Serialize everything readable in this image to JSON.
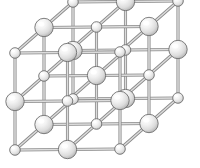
{
  "figure": {
    "title": "Rock-salt (NaCl-type) crystal lattice",
    "background_color": "#ffffff"
  },
  "style": {
    "large_sphere": {
      "radius": 9.2,
      "fill_light": "#ffffff",
      "fill_mid": "#e9e9e9",
      "fill_dark": "#b4b4b4",
      "stroke": "#6f6f6f",
      "stroke_width": 0.9
    },
    "small_sphere": {
      "radius": 5.3,
      "fill_light": "#ffffff",
      "fill_mid": "#ededed",
      "fill_dark": "#bcbcbc",
      "stroke": "#6f6f6f",
      "stroke_width": 0.9
    },
    "bond": {
      "outer_color": "#8a8a8a",
      "inner_color": "#dcdcdc",
      "outer_width": 3.1,
      "inner_width": 1.5
    }
  },
  "projection": {
    "type": "oblique-cavalier",
    "origin": {
      "x": 15,
      "y": 150
    },
    "axis_x": {
      "dx": 52.5,
      "dy": -0.5
    },
    "axis_y": {
      "dx": 0.0,
      "dy": -48.5
    },
    "axis_z": {
      "dx": 29.0,
      "dy": -25.5
    },
    "grid_counts": {
      "x": 3,
      "y": 3,
      "z": 3
    }
  },
  "lattice": {
    "kind": "rock-salt",
    "site_count": 27,
    "large_site_count": 13,
    "small_site_count": 14,
    "species": [
      {
        "name": "large-sphere-species",
        "label": "large ion",
        "size": "large"
      },
      {
        "name": "small-sphere-species",
        "label": "small ion",
        "size": "small"
      }
    ],
    "parity_rule": "a site (i,j,k) carries a large sphere when i+j+k is odd, otherwise a small sphere",
    "draw_order_note": "back layer (k=2) drawn first, then k=1, then front layer (k=0)"
  }
}
